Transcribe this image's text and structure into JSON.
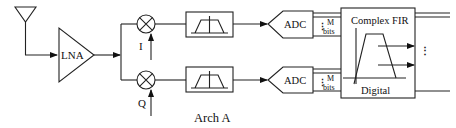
{
  "diagram": {
    "caption": "Arch A",
    "blocks": {
      "lna": "LNA",
      "adc_top": "ADC",
      "adc_bottom": "ADC",
      "fir_title": "Complex FIR",
      "fir_subtitle": "Digital"
    },
    "labels": {
      "i_branch": "I",
      "q_branch": "Q",
      "bits_top_m": "M",
      "bits_top_bits": "bits",
      "bits_bottom_m": "M",
      "bits_bottom_bits": "bits",
      "output_ellipsis": "⋮",
      "bus_ellipsis_top": "⋮",
      "bus_ellipsis_bottom": "⋮"
    },
    "icons": [
      "antenna-icon",
      "amplifier-icon",
      "mixer-icon",
      "bandpass-filter-icon",
      "adc-icon"
    ]
  }
}
